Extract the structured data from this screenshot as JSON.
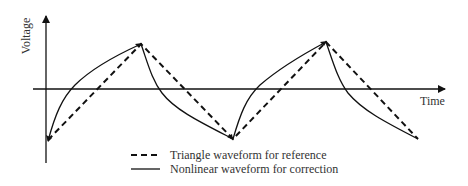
{
  "diagram": {
    "type": "waveform comparison",
    "axes": {
      "y_label": "Voltage",
      "x_label": "Time"
    },
    "legend": [
      {
        "style": "dashed",
        "label": "Triangle waveform for reference"
      },
      {
        "style": "solid",
        "label": "Nonlinear waveform for correction"
      }
    ],
    "colors": {
      "line": "#111111",
      "text": "#333333",
      "background": "#ffffff"
    }
  }
}
